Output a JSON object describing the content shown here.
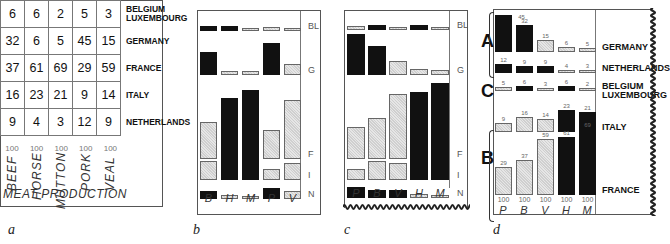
{
  "chart_data": [
    {
      "panel": "a",
      "type": "table",
      "title": "MEAT PRODUCTION",
      "columns": [
        "BEEF",
        "HORSE",
        "MUTTON",
        "PORK",
        "VEAL"
      ],
      "column_totals": [
        "100",
        "100",
        "100",
        "100",
        "100"
      ],
      "rows": [
        {
          "country": "BELGIUM LUXEMBOURG",
          "values": [
            6,
            6,
            2,
            5,
            3
          ]
        },
        {
          "country": "GERMANY",
          "values": [
            32,
            6,
            5,
            45,
            15
          ]
        },
        {
          "country": "FRANCE",
          "values": [
            37,
            61,
            69,
            29,
            59
          ]
        },
        {
          "country": "ITALY",
          "values": [
            16,
            23,
            21,
            9,
            14
          ]
        },
        {
          "country": "NETHERLANDS",
          "values": [
            9,
            4,
            3,
            12,
            9
          ]
        }
      ]
    },
    {
      "panel": "b",
      "type": "bar",
      "categories": [
        "B",
        "H",
        "M",
        "P",
        "V"
      ],
      "series": [
        {
          "name": "BL",
          "values": [
            6,
            6,
            2,
            5,
            3
          ],
          "fill": [
            "black",
            "black",
            "light",
            "light",
            "light"
          ]
        },
        {
          "name": "G",
          "values": [
            32,
            6,
            5,
            45,
            15
          ],
          "fill": [
            "black",
            "light",
            "light",
            "black",
            "light"
          ]
        },
        {
          "name": "F",
          "values": [
            37,
            61,
            69,
            29,
            59
          ],
          "fill": [
            "light",
            "black",
            "black",
            "light",
            "light"
          ]
        },
        {
          "name": "I",
          "values": [
            16,
            23,
            21,
            9,
            14
          ],
          "fill": [
            "light",
            "black",
            "black",
            "light",
            "light"
          ]
        },
        {
          "name": "N",
          "values": [
            9,
            4,
            3,
            12,
            9
          ],
          "fill": [
            "black",
            "light",
            "light",
            "black",
            "light"
          ]
        }
      ]
    },
    {
      "panel": "c",
      "type": "bar",
      "categories": [
        "P",
        "B",
        "V",
        "H",
        "M"
      ],
      "series": [
        {
          "name": "BL",
          "values": [
            5,
            6,
            3,
            6,
            2
          ],
          "fill": [
            "light",
            "black",
            "light",
            "black",
            "light"
          ]
        },
        {
          "name": "G",
          "values": [
            45,
            32,
            15,
            6,
            5
          ],
          "fill": [
            "black",
            "black",
            "light",
            "light",
            "light"
          ]
        },
        {
          "name": "F",
          "values": [
            29,
            37,
            59,
            61,
            69
          ],
          "fill": [
            "light",
            "light",
            "light",
            "black",
            "black"
          ]
        },
        {
          "name": "I",
          "values": [
            9,
            16,
            14,
            23,
            21
          ],
          "fill": [
            "light",
            "light",
            "light",
            "black",
            "black"
          ]
        },
        {
          "name": "N",
          "values": [
            12,
            9,
            9,
            4,
            3
          ],
          "fill": [
            "black",
            "black",
            "black",
            "light",
            "light"
          ]
        }
      ]
    },
    {
      "panel": "d",
      "type": "bar",
      "categories": [
        "P",
        "B",
        "V",
        "H",
        "M"
      ],
      "column_totals": [
        "100",
        "100",
        "100",
        "100",
        "100"
      ],
      "groups": [
        {
          "label": "A",
          "rows": [
            "GERMANY",
            "NETHERLANDS"
          ]
        },
        {
          "label": "C",
          "rows": [
            "BELGIUM LUXEMBOURG"
          ]
        },
        {
          "label": "B",
          "rows": [
            "ITALY",
            "FRANCE"
          ]
        }
      ],
      "series": [
        {
          "name": "GERMANY",
          "values": [
            45,
            32,
            15,
            6,
            5
          ],
          "fill": [
            "black",
            "black",
            "light",
            "light",
            "light"
          ]
        },
        {
          "name": "NETHERLANDS",
          "values": [
            12,
            9,
            9,
            4,
            3
          ],
          "fill": [
            "black",
            "black",
            "black",
            "light",
            "light"
          ]
        },
        {
          "name": "BELGIUM LUXEMBOURG",
          "values": [
            5,
            6,
            3,
            6,
            2
          ],
          "fill": [
            "light",
            "black",
            "light",
            "black",
            "light"
          ]
        },
        {
          "name": "ITALY",
          "values": [
            9,
            16,
            14,
            23,
            21
          ],
          "fill": [
            "light",
            "light",
            "light",
            "black",
            "black"
          ]
        },
        {
          "name": "FRANCE",
          "values": [
            29,
            37,
            59,
            61,
            69
          ],
          "fill": [
            "light",
            "light",
            "light",
            "black",
            "black"
          ]
        }
      ]
    }
  ],
  "captions": {
    "a": "a",
    "b": "b",
    "c": "c",
    "d": "d"
  },
  "panel_a": {
    "title": "MEAT PRODUCTION",
    "total_label": "100",
    "columns": [
      "BEEF",
      "HORSE",
      "MUTTON",
      "PORK",
      "VEAL"
    ],
    "rows": [
      {
        "label": "BELGIUM LUXEMBOURG",
        "values": [
          "6",
          "6",
          "2",
          "5",
          "3"
        ]
      },
      {
        "label": "GERMANY",
        "values": [
          "32",
          "6",
          "5",
          "45",
          "15"
        ]
      },
      {
        "label": "FRANCE",
        "values": [
          "37",
          "61",
          "69",
          "29",
          "59"
        ]
      },
      {
        "label": "ITALY",
        "values": [
          "16",
          "23",
          "21",
          "9",
          "14"
        ]
      },
      {
        "label": "NETHERLANDS",
        "values": [
          "9",
          "4",
          "3",
          "12",
          "9"
        ]
      }
    ]
  },
  "panel_b": {
    "row_labels": [
      "BL",
      "G",
      "F",
      "I",
      "N"
    ],
    "col_labels": [
      "B",
      "H",
      "M",
      "P",
      "V"
    ]
  },
  "panel_c": {
    "row_labels": [
      "BL",
      "G",
      "F",
      "I",
      "N"
    ],
    "col_labels": [
      "P",
      "B",
      "V",
      "H",
      "M"
    ]
  },
  "panel_d": {
    "row_labels": [
      "GERMANY",
      "NETHERLANDS",
      "BELGIUM LUXEMBOURG",
      "ITALY",
      "FRANCE"
    ],
    "col_labels": [
      "P",
      "B",
      "V",
      "H",
      "M"
    ],
    "group_labels": [
      "A",
      "C",
      "B"
    ],
    "total_label": "100"
  }
}
